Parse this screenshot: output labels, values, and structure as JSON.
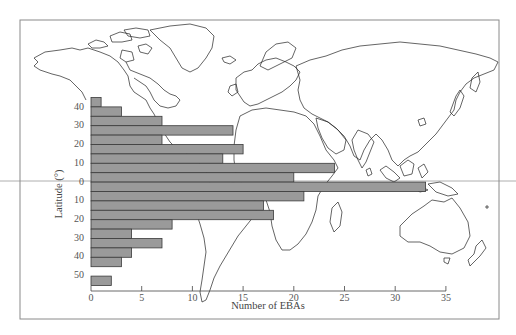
{
  "chart_data": {
    "type": "bar",
    "orientation": "horizontal",
    "title": "",
    "xlabel": "Number of EBAs",
    "ylabel": "Latitude (°)",
    "xlim": [
      0,
      35
    ],
    "x_ticks": [
      0,
      5,
      10,
      15,
      20,
      25,
      30,
      35
    ],
    "y_tick_labels": [
      "40",
      "30",
      "20",
      "10",
      "0",
      "10",
      "20",
      "30",
      "40",
      "50"
    ],
    "categories": [
      "45N",
      "40N",
      "35N",
      "30N",
      "25N",
      "20N",
      "15N",
      "10N",
      "5N",
      "0",
      "5S",
      "10S",
      "15S",
      "20S",
      "25S",
      "30S",
      "35S",
      "40S",
      "45S",
      "50S"
    ],
    "values": [
      1,
      3,
      7,
      14,
      7,
      15,
      13,
      24,
      20,
      33,
      21,
      17,
      18,
      8,
      4,
      7,
      4,
      3,
      0,
      2
    ],
    "background": "world map outline with equator line",
    "grid": false,
    "legend": null
  },
  "colors": {
    "bar_fill": "#9a9a9a",
    "bar_stroke": "#3a3a3a",
    "coastline": "#222222",
    "frame": "#8a8a8a"
  }
}
